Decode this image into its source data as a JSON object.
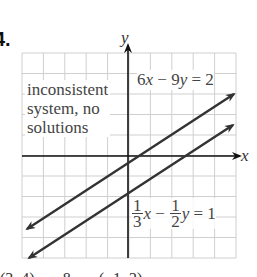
{
  "problem": {
    "number": "4."
  },
  "graph": {
    "grid": {
      "x0": 22,
      "y0": 53,
      "x1": 236,
      "y1": 258,
      "cols": 10,
      "rows": 10,
      "color": "#cfcfcf"
    },
    "axes": {
      "origin_x": 128,
      "origin_y": 156,
      "x_label": "x",
      "y_label": "y",
      "color": "#111111"
    },
    "lines": [
      {
        "name": "line-6x-9y-2",
        "equation": "6x − 9y = 2",
        "x1": 27,
        "y1": 229,
        "x2": 234,
        "y2": 94,
        "color": "#333333"
      },
      {
        "name": "line-third-x-half-y-1",
        "equation": "1/3 x − 1/2 y = 1",
        "x1": 29,
        "y1": 258,
        "x2": 233,
        "y2": 125,
        "color": "#333333"
      }
    ]
  },
  "annotation": {
    "line1": "inconsistent",
    "line2": "system, no",
    "line3": "solutions"
  },
  "equations": {
    "eq1": {
      "a": "6",
      "x": "x",
      "minus": " − 9",
      "y": "y",
      "rhs": " = 2"
    },
    "eq2": {
      "frac1_num": "1",
      "frac1_den": "3",
      "x": "x",
      "minus": " − ",
      "frac2_num": "1",
      "frac2_den": "2",
      "y": "y",
      "rhs": " = 1"
    }
  },
  "chart_data": {
    "type": "line",
    "title": "inconsistent system, no solutions",
    "xlabel": "x",
    "ylabel": "y",
    "grid": true,
    "series": [
      {
        "name": "6x − 9y = 2",
        "slope": 0.6667,
        "intercept": -0.2222
      },
      {
        "name": "(1/3)x − (1/2)y = 1",
        "slope": 0.6667,
        "intercept": -2
      }
    ],
    "xlim": [
      -5,
      5
    ],
    "ylim": [
      -5,
      5
    ],
    "annotations": [
      "inconsistent system, no solutions"
    ]
  },
  "footer_cut_text": "(3, 4)   ,   8   ,   (−1, 2)"
}
